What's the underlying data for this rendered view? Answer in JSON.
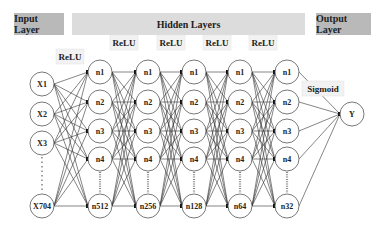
{
  "headers": {
    "input": "Input Layer",
    "hidden": "Hidden Layers",
    "output": "Output Layer"
  },
  "input_layer": {
    "nodes": [
      "X1",
      "X2",
      "X3",
      "X704"
    ]
  },
  "hidden_layers": [
    {
      "activation": "ReLU",
      "nodes": [
        "n1",
        "n2",
        "n3",
        "n4",
        "n512"
      ]
    },
    {
      "activation": "ReLU",
      "nodes": [
        "n1",
        "n2",
        "n3",
        "n4",
        "n256"
      ]
    },
    {
      "activation": "ReLU",
      "nodes": [
        "n1",
        "n2",
        "n3",
        "n4",
        "n128"
      ]
    },
    {
      "activation": "ReLU",
      "nodes": [
        "n1",
        "n2",
        "n3",
        "n4",
        "n64"
      ]
    },
    {
      "activation": "ReLU",
      "nodes": [
        "n1",
        "n2",
        "n3",
        "n4",
        "n32"
      ]
    }
  ],
  "output_layer": {
    "activation": "Sigmoid",
    "nodes": [
      "Y"
    ]
  },
  "colors": {
    "header_dark": "#b9b9b9",
    "header_light": "#dcdcdc",
    "node_stroke": "#555555",
    "edge": "#333333",
    "label_bg": "#f2f2f2"
  }
}
